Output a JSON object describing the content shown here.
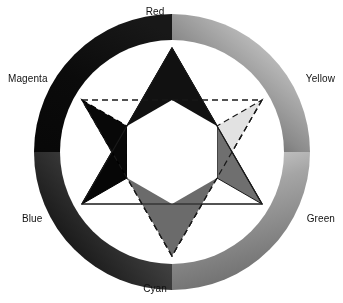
{
  "figure": {
    "background": "#ffffff",
    "width": 343,
    "height": 303,
    "geometry": {
      "center_x": 172,
      "center_y": 152,
      "ring_outer_radius": 138,
      "ring_inner_radius": 112,
      "star_circumradius": 104
    }
  },
  "ring": {
    "name": "color-wheel-ring",
    "description": "Grayscale-printed hue ring encircling the star, dark at magenta/blue and light at yellow",
    "stops": [
      {
        "label": "Red",
        "angle_deg": 0,
        "gray": "#1a1a1a"
      },
      {
        "label": "Yellow",
        "angle_deg": 60,
        "gray": "#d8d8d8"
      },
      {
        "label": "Green",
        "angle_deg": 120,
        "gray": "#7d7d7d"
      },
      {
        "label": "Cyan",
        "angle_deg": 180,
        "gray": "#616161"
      },
      {
        "label": "Blue",
        "angle_deg": 240,
        "gray": "#0a0a0a"
      },
      {
        "label": "Magenta",
        "angle_deg": 300,
        "gray": "#0d0d0d"
      }
    ]
  },
  "labels": {
    "red": "Red",
    "yellow": "Yellow",
    "green": "Green",
    "cyan": "Cyan",
    "blue": "Blue",
    "magenta": "Magenta"
  },
  "star": {
    "name": "star-of-david",
    "upward_triangle": {
      "name": "additive-primaries-triangle",
      "edge_style": "solid",
      "points": [
        "Red",
        "Blue",
        "Green"
      ]
    },
    "downward_triangle": {
      "name": "subtractive-primaries-triangle",
      "edge_style": "dashed",
      "points": [
        "Cyan",
        "Magenta",
        "Yellow"
      ]
    },
    "points": [
      {
        "label": "Red",
        "angle_deg": 0,
        "fill": "#111111",
        "outline": "#000000",
        "dashed": false
      },
      {
        "label": "Yellow",
        "angle_deg": 60,
        "fill": "#e2e2e2",
        "outline": "#1a1a1a",
        "dashed": true
      },
      {
        "label": "Green",
        "angle_deg": 120,
        "fill": "#6f6f6f",
        "outline": "#1a1a1a",
        "dashed": false
      },
      {
        "label": "Cyan",
        "angle_deg": 180,
        "fill": "#6b6b6b",
        "outline": "#1a1a1a",
        "dashed": true
      },
      {
        "label": "Blue",
        "angle_deg": 240,
        "fill": "#060606",
        "outline": "#000000",
        "dashed": false
      },
      {
        "label": "Magenta",
        "angle_deg": 300,
        "fill": "#080808",
        "outline": "#000000",
        "dashed": true
      }
    ],
    "center_fill": "#ffffff"
  }
}
